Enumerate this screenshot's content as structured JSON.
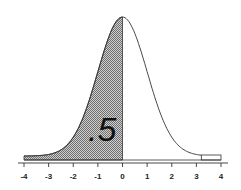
{
  "chart_data": {
    "type": "area",
    "title": "",
    "xlabel": "",
    "ylabel": "",
    "distribution": {
      "name": "standard normal",
      "mean": 0,
      "sd": 1
    },
    "shaded_region": {
      "from": -4,
      "to": 0,
      "area": 0.5
    },
    "annotation": ".5",
    "x_ticks": [
      -4,
      -3,
      -2,
      -1,
      0,
      1,
      2,
      3,
      4
    ],
    "x_tick_labels": [
      "-4",
      "-3",
      "-2",
      "-1",
      "0",
      "1",
      "2",
      "3",
      "4"
    ],
    "xlim": [
      -4,
      4
    ],
    "grid": false,
    "legend": null
  },
  "colors": {
    "shade": "#9a9a9a",
    "curve": "#333333",
    "axis": "#333333"
  }
}
